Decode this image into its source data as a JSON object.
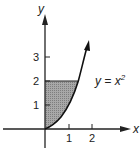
{
  "diagram": {
    "axes": {
      "x_label": "x",
      "y_label": "y",
      "x_ticks": [
        "1",
        "2"
      ],
      "y_ticks": [
        "1",
        "2",
        "3"
      ]
    },
    "curve": {
      "equation_lhs": "y = x",
      "equation_exponent": "2"
    },
    "shaded_region": {
      "description": "Region between y-axis, y = 2, and curve y = x^2",
      "color": "#9a9a9a"
    },
    "colors": {
      "ink": "#222222",
      "background": "#ffffff"
    }
  }
}
